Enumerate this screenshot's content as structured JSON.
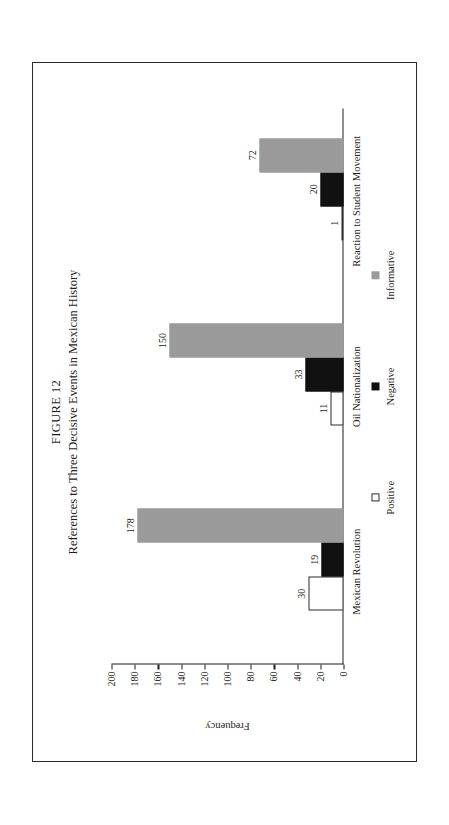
{
  "figure": {
    "number": "FIGURE 12",
    "title": "References to Three Decisive Events in Mexican History"
  },
  "chart_data": {
    "type": "bar",
    "title": "References to Three Decisive Events in Mexican History",
    "xlabel": "",
    "ylabel": "Frequency",
    "orientation": "vertical",
    "ylim": [
      0,
      200
    ],
    "ytick_step": 20,
    "yticks": [
      200,
      180,
      160,
      140,
      120,
      100,
      80,
      60,
      40,
      20,
      0
    ],
    "ytick_labels": [
      "200",
      "180",
      "160",
      "140",
      "120",
      "100",
      "80",
      "60",
      "40",
      "20",
      "0"
    ],
    "grid": false,
    "legend_position": "below-axis",
    "categories": [
      "Mexican Revolution",
      "Oil Nationalization",
      "Reaction to Student Movement"
    ],
    "series": [
      {
        "name": "Positive",
        "color": "#ffffff",
        "edge_color": "#2b2b2b",
        "values": [
          30,
          11,
          1
        ],
        "labels": [
          "30",
          "11",
          "1"
        ]
      },
      {
        "name": "Negative",
        "color": "#111111",
        "edge_color": "#111111",
        "values": [
          19,
          33,
          20
        ],
        "labels": [
          "19",
          "33",
          "20"
        ]
      },
      {
        "name": "Informative",
        "color": "#9a9a9a",
        "edge_color": "#9a9a9a",
        "values": [
          178,
          150,
          72
        ],
        "labels": [
          "178",
          "150",
          "72"
        ]
      }
    ]
  },
  "legend": {
    "items": [
      {
        "label": "Positive",
        "swatch": "legend-swatch-positive"
      },
      {
        "label": "Negative",
        "swatch": "legend-swatch-negative"
      },
      {
        "label": "Informative",
        "swatch": "legend-swatch-informative"
      }
    ]
  }
}
